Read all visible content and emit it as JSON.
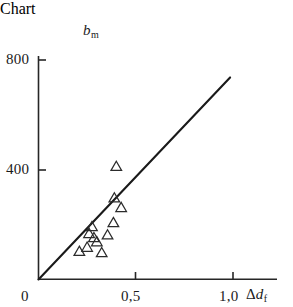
{
  "chart_data": {
    "type": "scatter",
    "title": "",
    "xlabel": "Δd_f",
    "ylabel": "b_m",
    "xlim": [
      0,
      1.15
    ],
    "ylim": [
      0,
      820
    ],
    "grid": false,
    "legend": null,
    "marker": "open-triangle",
    "x_tick_values": [
      0,
      0.5,
      1.0
    ],
    "x_tick_labels": [
      "0",
      "0,5",
      "1,0"
    ],
    "y_tick_values": [
      400,
      800
    ],
    "y_tick_labels": [
      "400",
      "800"
    ],
    "points": [
      {
        "x": 0.21,
        "y": 105
      },
      {
        "x": 0.25,
        "y": 120
      },
      {
        "x": 0.26,
        "y": 170
      },
      {
        "x": 0.275,
        "y": 195
      },
      {
        "x": 0.285,
        "y": 155
      },
      {
        "x": 0.3,
        "y": 140
      },
      {
        "x": 0.325,
        "y": 100
      },
      {
        "x": 0.355,
        "y": 165
      },
      {
        "x": 0.385,
        "y": 210
      },
      {
        "x": 0.39,
        "y": 300
      },
      {
        "x": 0.4,
        "y": 415
      },
      {
        "x": 0.425,
        "y": 265
      }
    ],
    "fit_line": {
      "label": "",
      "x_start": 0.0,
      "y_start": 0,
      "x_end": 0.985,
      "y_end": 738,
      "slope": 749,
      "intercept": 0
    },
    "series": [
      {
        "name": "measurements",
        "x": [
          0.21,
          0.25,
          0.26,
          0.275,
          0.285,
          0.3,
          0.325,
          0.355,
          0.385,
          0.39,
          0.4,
          0.425
        ],
        "values": [
          105,
          120,
          170,
          195,
          155,
          140,
          100,
          165,
          210,
          300,
          415,
          265
        ]
      }
    ]
  },
  "axes": {
    "y_title": "b",
    "y_title_sub": "m",
    "x_title_delta": "Δ",
    "x_title_var": "d",
    "x_title_sub": "f",
    "ticks": {
      "y800": "800",
      "y400": "400",
      "x0": "0",
      "x05": "0,5",
      "x10": "1,0"
    }
  },
  "colors": {
    "axis": "#262626",
    "line": "#1a1a1a",
    "marker_stroke": "#2b2b2b",
    "background": "#ffffff",
    "text": "#1a1a1a"
  }
}
